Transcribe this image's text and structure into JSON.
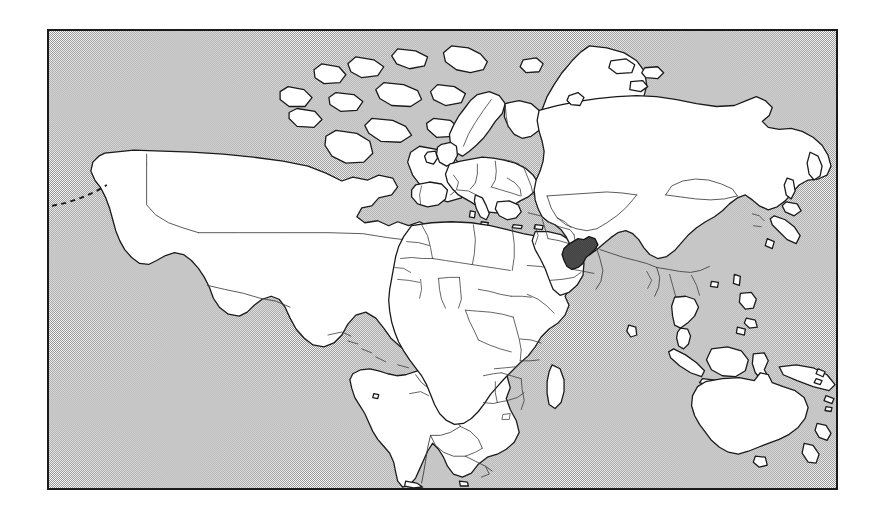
{
  "figure": {
    "kind": "world-locator-map",
    "title": "World map locating Afghanistan",
    "caption": "",
    "background_color": "#ffffff"
  },
  "frame": {
    "border_color": "#1a1a1a",
    "border_width_px": 2,
    "x": 47,
    "y": 29,
    "width": 791,
    "height": 461
  },
  "map": {
    "projection": "equirectangular",
    "lon_range": [
      -180,
      180
    ],
    "lat_range": [
      -58,
      84
    ],
    "ocean_style": "dithered-halftone-gray",
    "ocean_color": "#b2b2b2",
    "ocean_dot_color": "#808080",
    "land_fill": "#ffffff",
    "coastline_color": "#1a1a1a",
    "border_color": "#3c3c3c",
    "highlight_fill": "#5a5a5a",
    "highlight_outline": "#141414",
    "graticule": "none",
    "labels": "none"
  },
  "highlighted": {
    "name": "Afghanistan",
    "fill_color": "#5a5a5a",
    "pattern": "dense-crosshatch",
    "center_px": {
      "x": 588,
      "y": 256
    }
  },
  "legend": {
    "present": false,
    "entries": []
  },
  "continents": [
    {
      "name": "North America"
    },
    {
      "name": "South America"
    },
    {
      "name": "Greenland"
    },
    {
      "name": "Europe"
    },
    {
      "name": "Africa"
    },
    {
      "name": "Asia"
    },
    {
      "name": "Australia"
    },
    {
      "name": "New Zealand"
    }
  ],
  "notes": {
    "aleutian_chain": "dashed island chain west of Alaska",
    "madagascar": "island east of southern Africa",
    "iceland": "island north-west of Europe",
    "japan": "island arc east of Asia",
    "indonesia": "island arc north-west of Australia"
  }
}
